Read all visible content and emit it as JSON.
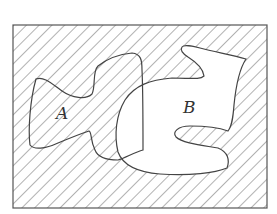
{
  "diagram": {
    "type": "venn",
    "universe": {
      "x": 13,
      "y": 25,
      "width": 254,
      "height": 183
    },
    "sets": [
      {
        "label": "A",
        "label_pos": [
          62,
          113
        ]
      },
      {
        "label": "B",
        "label_pos": [
          190,
          113
        ]
      }
    ],
    "shaded_region": "complement of B",
    "hatch": {
      "direction": "diagonal-down-right",
      "spacing": 9,
      "color": "#555555"
    },
    "stroke_color": "#444444",
    "fill_color": "#ffffff"
  }
}
